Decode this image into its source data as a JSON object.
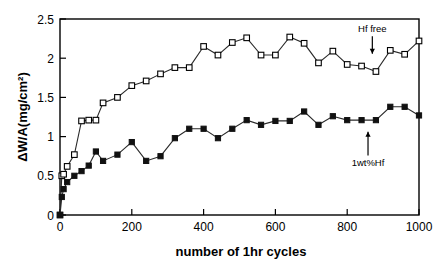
{
  "chart_data": {
    "type": "line",
    "title": "",
    "xlabel": "number of 1hr cycles",
    "ylabel": "ΔW/A(mg/cm²)",
    "xlim": [
      0,
      1000
    ],
    "ylim": [
      0,
      2.5
    ],
    "xticks": [
      0,
      200,
      400,
      600,
      800,
      1000
    ],
    "xticklabels": [
      "0",
      "200",
      "400",
      "600",
      "800",
      "1000"
    ],
    "yticks": [
      0,
      0.5,
      1,
      1.5,
      2,
      2.5
    ],
    "yticklabels": [
      "0",
      "0.5",
      "1",
      "1.5",
      "2",
      "2.5"
    ],
    "grid": false,
    "legend": "none",
    "series": [
      {
        "name": "Hf free",
        "marker": "open-square",
        "color": "#000000",
        "x": [
          0,
          5,
          10,
          20,
          40,
          60,
          80,
          100,
          120,
          160,
          200,
          240,
          280,
          320,
          360,
          400,
          440,
          480,
          520,
          560,
          600,
          640,
          680,
          720,
          760,
          800,
          840,
          880,
          920,
          960,
          1000
        ],
        "y": [
          0.0,
          0.5,
          0.52,
          0.62,
          0.77,
          1.2,
          1.21,
          1.21,
          1.43,
          1.5,
          1.65,
          1.71,
          1.8,
          1.88,
          1.88,
          2.15,
          2.04,
          2.2,
          2.26,
          2.04,
          2.04,
          2.27,
          2.19,
          1.94,
          2.09,
          1.92,
          1.9,
          1.83,
          2.1,
          2.05,
          2.22
        ]
      },
      {
        "name": "1wt%Hf",
        "marker": "filled-square",
        "color": "#111111",
        "x": [
          0,
          5,
          10,
          20,
          40,
          60,
          80,
          100,
          120,
          160,
          200,
          240,
          280,
          320,
          360,
          400,
          440,
          480,
          520,
          560,
          600,
          640,
          680,
          720,
          760,
          800,
          840,
          880,
          920,
          960,
          1000
        ],
        "y": [
          0.0,
          0.23,
          0.33,
          0.42,
          0.5,
          0.56,
          0.63,
          0.81,
          0.69,
          0.77,
          0.93,
          0.69,
          0.75,
          0.98,
          1.1,
          1.1,
          0.98,
          1.1,
          1.21,
          1.15,
          1.2,
          1.2,
          1.32,
          1.15,
          1.26,
          1.21,
          1.21,
          1.21,
          1.38,
          1.38,
          1.27
        ]
      }
    ],
    "annotations": [
      {
        "name": "hf-free-annotation",
        "text": "Hf free",
        "x": 870,
        "y": 2.33,
        "arrow_direction": "down",
        "arrow_target_y": 2.03
      },
      {
        "name": "one-wt-pct-hf-annotation",
        "text": "1wt%Hf",
        "x": 858,
        "y": 0.62,
        "arrow_direction": "up",
        "arrow_target_y": 1.1
      }
    ]
  }
}
